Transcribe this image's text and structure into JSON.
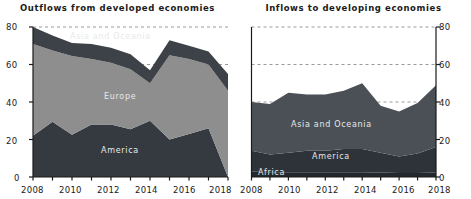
{
  "chart_data": [
    {
      "type": "area",
      "title": "Outflows from developed economies",
      "stacked": true,
      "xlabel": "",
      "ylabel": "",
      "x": [
        2008,
        2009,
        2010,
        2011,
        2012,
        2013,
        2014,
        2015,
        2016,
        2017,
        2018
      ],
      "xticklabels": [
        "2008",
        "2010",
        "2012",
        "2014",
        "2016",
        "2018"
      ],
      "xlim": [
        2008,
        2018
      ],
      "ylim": [
        0,
        80
      ],
      "yticks": [
        0,
        20,
        40,
        60,
        80
      ],
      "yticklabels": [
        "0",
        "20",
        "40",
        "60",
        "80"
      ],
      "ytick_side": "left",
      "grid": "dashed-horizontal",
      "legend": "inline-labels",
      "series": [
        {
          "name": "America",
          "values": [
            22,
            29.5,
            22.5,
            28,
            28,
            25.5,
            30,
            20,
            23,
            26,
            0
          ],
          "color": "#343a40"
        },
        {
          "name": "Europe",
          "values": [
            49,
            38,
            42,
            35,
            33,
            32,
            20,
            45,
            40,
            34,
            46
          ],
          "color": "#8e8e8e"
        },
        {
          "name": "Asia and Oceania",
          "values": [
            9,
            8,
            7,
            8,
            8,
            8,
            7,
            8,
            7,
            7,
            9
          ],
          "color": "#3c4248"
        }
      ],
      "totals": [
        80,
        75.5,
        71.5,
        71,
        69,
        65.5,
        57,
        73,
        70,
        67,
        55
      ]
    },
    {
      "type": "area",
      "title": "Inflows to developing economies",
      "stacked": true,
      "xlabel": "",
      "ylabel": "",
      "x": [
        2008,
        2009,
        2010,
        2011,
        2012,
        2013,
        2014,
        2015,
        2016,
        2017,
        2018
      ],
      "xticklabels": [
        "2008",
        "2010",
        "2012",
        "2014",
        "2016",
        "2018"
      ],
      "xlim": [
        2008,
        2018
      ],
      "ylim": [
        0,
        80
      ],
      "yticks": [
        0,
        20,
        40,
        60,
        80
      ],
      "yticklabels": [
        "0",
        "20",
        "40",
        "60",
        "80"
      ],
      "ytick_side": "right",
      "grid": "dashed-horizontal",
      "legend": "inline-labels",
      "series": [
        {
          "name": "Africa",
          "values": [
            3.0,
            2.6,
            2.6,
            2.6,
            2.6,
            2.6,
            2.6,
            2.4,
            2.2,
            2.2,
            2.4
          ],
          "color": "#23282d"
        },
        {
          "name": "America",
          "values": [
            11.0,
            9.4,
            10.4,
            11.4,
            11.4,
            12.4,
            12.4,
            10.6,
            8.8,
            10.3,
            13.6
          ],
          "color": "#2d3339"
        },
        {
          "name": "Asia and Oceania",
          "values": [
            26.0,
            27.0,
            32.0,
            30.0,
            30.0,
            31.0,
            35.0,
            25.0,
            24.0,
            27.0,
            33.0
          ],
          "color": "#4a5056"
        }
      ],
      "totals": [
        40,
        39,
        45,
        44,
        44,
        46,
        50,
        38,
        35,
        39.5,
        49
      ]
    }
  ]
}
